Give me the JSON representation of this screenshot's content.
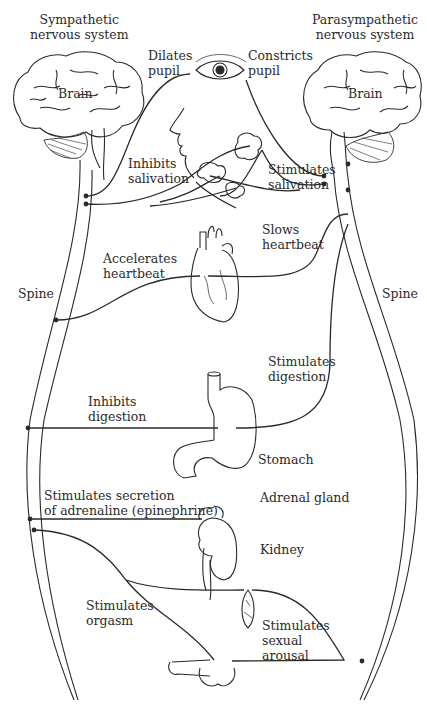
{
  "diagram": {
    "type": "anatomical-neural-pathway",
    "title_left": "Sympathetic\nnervous system",
    "title_right": "Parasympathetic\nnervous system",
    "structures": {
      "brain_left": "Brain",
      "brain_right": "Brain",
      "spine_left": "Spine",
      "spine_right": "Spine",
      "stomach": "Stomach",
      "adrenal_gland": "Adrenal gland",
      "kidney": "Kidney"
    },
    "sympathetic_effects": {
      "eye": "Dilates\npupil",
      "salivary": "Inhibits\nsalivation",
      "heart": "Accelerates\nheartbeat",
      "stomach": "Inhibits\ndigestion",
      "adrenal": "Stimulates secretion\nof adrenaline (epinephrine)",
      "sexual": "Stimulates\norgasm"
    },
    "parasympathetic_effects": {
      "eye": "Constricts\npupil",
      "salivary": "Stimulates\nsalivation",
      "heart": "Slows\nheartbeat",
      "stomach": "Stimulates\ndigestion",
      "sexual": "Stimulates\nsexual\narousal"
    },
    "colors": {
      "line": "#2a2a2a",
      "background": "#ffffff"
    }
  }
}
